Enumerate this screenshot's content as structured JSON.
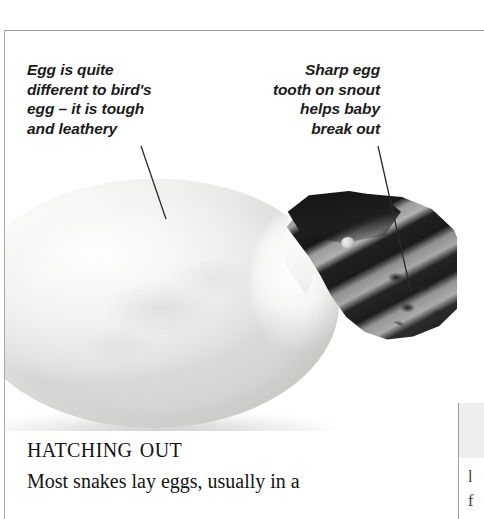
{
  "page": {
    "background_color": "#ffffff",
    "rule_color": "#9a9a9a"
  },
  "illustration": {
    "subject": "snake hatching from egg",
    "egg": {
      "name": "snake-egg",
      "description": "large white leathery egg lying on its side",
      "fill_color": "#f2f2f0",
      "shadow_color": "#8a8a8a"
    },
    "snake": {
      "name": "baby-snake-head",
      "description": "banded snake head emerging from torn shell",
      "dark_band_color": "#1b1b1b",
      "light_band_color": "#a6a6a6"
    }
  },
  "annotations": [
    {
      "id": "egg-texture",
      "name": "annotation-egg-texture",
      "text": "Egg is quite\ndifferent to bird's\negg – it is tough\nand leathery",
      "align": "left"
    },
    {
      "id": "egg-tooth",
      "name": "annotation-egg-tooth",
      "text": "Sharp egg\ntooth on snout\nhelps baby\nbreak out",
      "align": "right"
    }
  ],
  "article": {
    "heading": "Hatching out",
    "body": "Most snakes lay eggs, usually in a"
  },
  "side_column": {
    "fragment_1": "l",
    "fragment_2": "f"
  }
}
